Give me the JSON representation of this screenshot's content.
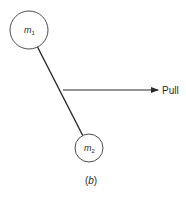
{
  "diagram": {
    "masses": [
      {
        "id": "m1",
        "symbol": "m",
        "subscript": "1"
      },
      {
        "id": "m2",
        "symbol": "m",
        "subscript": "2"
      }
    ],
    "force_label": "Pull",
    "caption_prefix": "(",
    "caption_letter": "b",
    "caption_suffix": ")",
    "colors": {
      "stroke": "#2a2a2a",
      "background": "#ffffff"
    }
  }
}
